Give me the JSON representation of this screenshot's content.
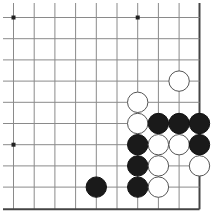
{
  "board": {
    "description": "Go board corner excerpt (bottom-right corner)",
    "columns_x": [
      13.5,
      34.2,
      54.9,
      75.6,
      96.3,
      117.0,
      137.7,
      158.4,
      179.1,
      199.5
    ],
    "rows_y": [
      17.5,
      38.7,
      59.9,
      81.1,
      102.3,
      123.5,
      144.7,
      165.9,
      187.1,
      209.3
    ],
    "extent": {
      "left": 3,
      "top": 3,
      "right": 199.5,
      "bottom": 209.3
    },
    "edges": [
      "right",
      "bottom"
    ],
    "colors": {
      "grid": "#8a8a8a",
      "edge": "#444444",
      "black": "#1a1a1a",
      "white": "#ffffff",
      "white_outline": "#555555"
    },
    "stone_radius": 10.2,
    "star_points": [
      {
        "col": 0,
        "row": 0
      },
      {
        "col": 6,
        "row": 0
      },
      {
        "col": 0,
        "row": 6
      }
    ],
    "stones": [
      {
        "color": "white",
        "col": 8,
        "row": 3
      },
      {
        "color": "white",
        "col": 6,
        "row": 4
      },
      {
        "color": "white",
        "col": 6,
        "row": 5
      },
      {
        "color": "black",
        "col": 7,
        "row": 5
      },
      {
        "color": "black",
        "col": 8,
        "row": 5
      },
      {
        "color": "black",
        "col": 9,
        "row": 5
      },
      {
        "color": "black",
        "col": 6,
        "row": 6
      },
      {
        "color": "white",
        "col": 7,
        "row": 6
      },
      {
        "color": "white",
        "col": 8,
        "row": 6
      },
      {
        "color": "black",
        "col": 9,
        "row": 6
      },
      {
        "color": "black",
        "col": 6,
        "row": 7
      },
      {
        "color": "white",
        "col": 7,
        "row": 7
      },
      {
        "color": "white",
        "col": 9,
        "row": 7
      },
      {
        "color": "black",
        "col": 4,
        "row": 8
      },
      {
        "color": "black",
        "col": 6,
        "row": 8
      },
      {
        "color": "white",
        "col": 7,
        "row": 8
      }
    ]
  }
}
